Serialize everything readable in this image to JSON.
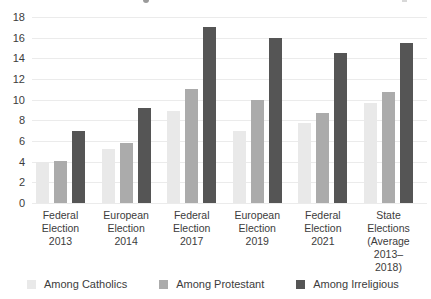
{
  "colors": {
    "background": "#ffffff",
    "text": "#3c3c3c",
    "gridline": "#ebebeb",
    "series_catholics": "#e9e9e9",
    "series_protestant": "#ababab",
    "series_irreligious": "#555555"
  },
  "chart_data": {
    "type": "bar",
    "title": "",
    "xlabel": "",
    "ylabel": "",
    "ylim": [
      0,
      18
    ],
    "grid": true,
    "legend_position": "bottom",
    "y_ticks": [
      0,
      2,
      4,
      6,
      8,
      10,
      12,
      14,
      16,
      18
    ],
    "categories": [
      "Federal Election 2013",
      "European Election 2014",
      "Federal Election 2017",
      "European Election 2019",
      "Federal Election 2021",
      "State Elections (Average 2013–2018)"
    ],
    "category_lines": [
      [
        "Federal",
        "Election",
        "2013"
      ],
      [
        "European",
        "Election",
        "2014"
      ],
      [
        "Federal",
        "Election",
        "2017"
      ],
      [
        "European",
        "Election",
        "2019"
      ],
      [
        "Federal",
        "Election",
        "2021"
      ],
      [
        "State",
        "Elections",
        "(Average",
        "2013–2018)"
      ]
    ],
    "series": [
      {
        "name": "Among Catholics",
        "color": "#e9e9e9",
        "values": [
          4.0,
          5.2,
          8.9,
          7.0,
          7.7,
          9.7
        ]
      },
      {
        "name": "Among Protestant",
        "color": "#ababab",
        "values": [
          4.1,
          5.8,
          11.0,
          10.0,
          8.7,
          10.7
        ]
      },
      {
        "name": "Among Irreligious",
        "color": "#555555",
        "values": [
          7.0,
          9.2,
          17.0,
          16.0,
          14.5,
          15.5
        ]
      }
    ]
  }
}
